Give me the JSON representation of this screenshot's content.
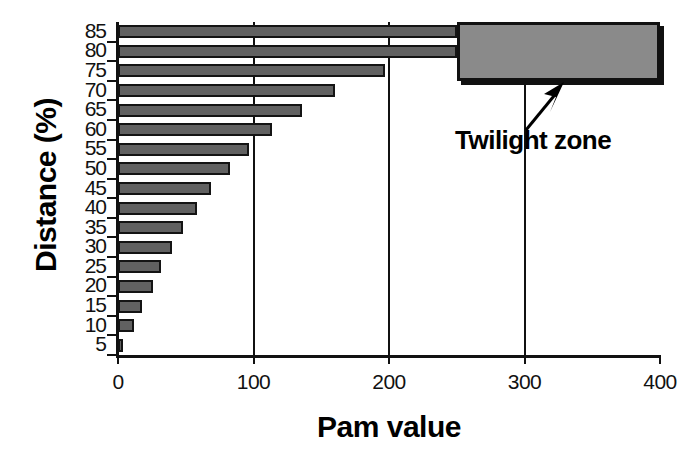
{
  "chart_data": {
    "type": "bar",
    "orientation": "horizontal",
    "title": "",
    "xlabel": "Pam value",
    "ylabel": "Distance (%)",
    "categories": [
      "85",
      "80",
      "75",
      "70",
      "65",
      "60",
      "55",
      "50",
      "45",
      "40",
      "35",
      "30",
      "25",
      "20",
      "15",
      "10",
      "5"
    ],
    "values": [
      250,
      250,
      197,
      160,
      136,
      114,
      97,
      83,
      69,
      58,
      48,
      40,
      32,
      26,
      18,
      12,
      4
    ],
    "xlim": [
      0,
      400
    ],
    "xticks": [
      "0",
      "100",
      "200",
      "300",
      "400"
    ],
    "xtick_values": [
      0,
      100,
      200,
      300,
      400
    ],
    "gridlines": [
      100,
      200,
      300
    ],
    "grid": "vertical-only",
    "bar_color": "#616161",
    "bar_edge_color": "#141414",
    "annotations": [
      {
        "text": "Twilight zone",
        "type": "arrow-callout",
        "region_start": 250,
        "region_end": 400,
        "region_color": "#8a8a8a"
      }
    ],
    "legend": "none",
    "note_bars_truncated": "The 85 and 80 bars are clipped by the Twilight zone region box at 250"
  },
  "axes": {
    "y_title": "Distance (%)",
    "x_title": "Pam value"
  },
  "annotation": {
    "twilight_label": "Twilight zone"
  }
}
